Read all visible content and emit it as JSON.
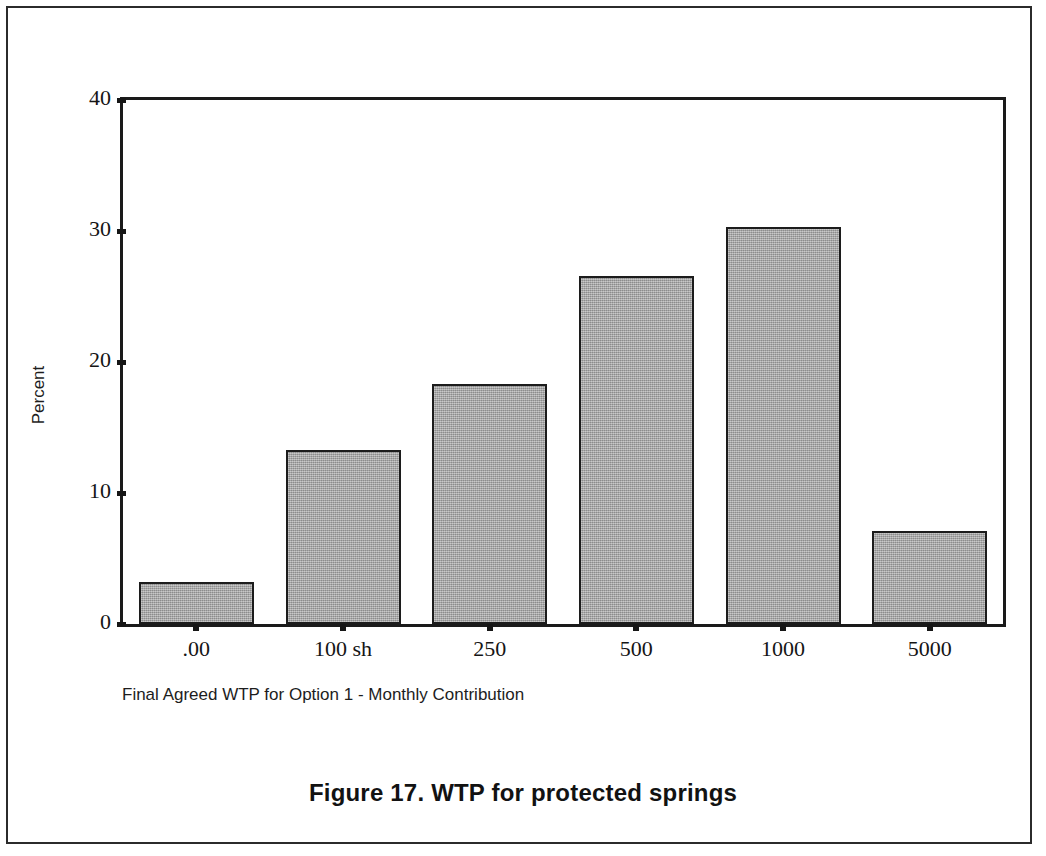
{
  "figure": {
    "caption": "Figure 17. WTP for protected springs"
  },
  "chart_data": {
    "type": "bar",
    "title": "",
    "xlabel": "Final Agreed WTP for Option 1 - Monthly Contribution",
    "ylabel": "Percent",
    "categories": [
      ".00",
      "100 sh",
      "250",
      "500",
      "1000",
      "5000"
    ],
    "values": [
      3.2,
      13.3,
      18.3,
      26.6,
      30.3,
      7.1
    ],
    "ylim": [
      0,
      40
    ],
    "yticks": [
      0,
      10,
      20,
      30,
      40
    ],
    "ytick_labels": [
      "0",
      "10",
      "20",
      "30",
      "40"
    ],
    "grid": false,
    "legend": null,
    "bar_fill_color": "#a9a9a9",
    "bar_edge_color": "#1c1c1c",
    "axis_color": "#1a1a1a",
    "background_color": "#ffffff"
  }
}
